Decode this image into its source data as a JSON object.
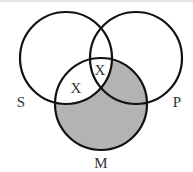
{
  "diagram": {
    "type": "venn-3",
    "circles": [
      {
        "id": "S",
        "label": "S",
        "cx": 66,
        "cy": 58,
        "r": 46,
        "label_x": 21,
        "label_y": 107
      },
      {
        "id": "P",
        "label": "P",
        "cx": 136,
        "cy": 58,
        "r": 46,
        "label_x": 177,
        "label_y": 107
      },
      {
        "id": "M",
        "label": "M",
        "cx": 101,
        "cy": 104,
        "r": 46,
        "label_x": 101,
        "label_y": 168
      }
    ],
    "shaded_regions": [
      "M only",
      "M∩P not S"
    ],
    "shade_color": "#b3b3b3",
    "stroke_color": "#111111",
    "marks": [
      {
        "text": "X",
        "region": "S∩M not P",
        "x": 76,
        "y": 93
      },
      {
        "text": "X",
        "region": "S∩P (on M boundary)",
        "x": 100,
        "y": 75
      }
    ]
  }
}
